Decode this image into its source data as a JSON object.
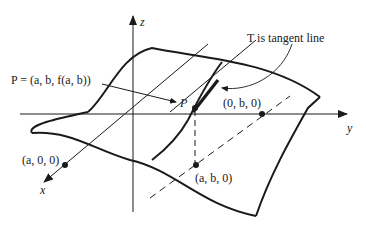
{
  "diagram": {
    "type": "3d-surface-tangent",
    "labels": {
      "z_axis": "z",
      "y_axis": "y",
      "x_axis": "x",
      "point_P_def": "P = (a, b, f(a, b))",
      "point_P": "P",
      "tangent_note": "T is tangent line",
      "point_0b0": "(0, b, 0)",
      "point_a00": "(a, 0, 0)",
      "point_ab0": "(a, b, 0)"
    },
    "colors": {
      "ink": "#1a1a1a",
      "background": "#ffffff"
    }
  }
}
